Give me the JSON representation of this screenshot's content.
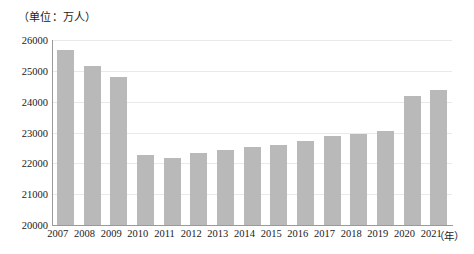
{
  "chart_data": {
    "type": "bar",
    "title": "",
    "unit_caption": "（单位：万人）",
    "xlabel": "（年）",
    "ylabel": "",
    "categories": [
      "2007",
      "2008",
      "2009",
      "2010",
      "2011",
      "2012",
      "2013",
      "2014",
      "2015",
      "2016",
      "2017",
      "2018",
      "2019",
      "2020",
      "2021"
    ],
    "values": [
      25660,
      25160,
      24790,
      22260,
      22170,
      22330,
      22420,
      22530,
      22600,
      22720,
      22880,
      22960,
      23060,
      24180,
      24390
    ],
    "ylim": [
      20000,
      26000
    ],
    "yticks": [
      20000,
      21000,
      22000,
      23000,
      24000,
      25000,
      26000
    ],
    "ytick_labels": [
      "20000",
      "21000",
      "22000",
      "23000",
      "24000",
      "25000",
      "26000"
    ],
    "grid": true,
    "legend": false,
    "bar_color": "#b9b9b9",
    "axis_color": "#9a9a9a",
    "grid_color": "#e9e9e9",
    "text_color": "#1a1a1a"
  }
}
